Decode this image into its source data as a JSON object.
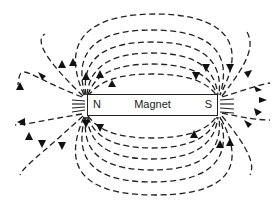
{
  "diagram": {
    "type": "magnetic-field-lines",
    "magnet": {
      "label": "Magnet",
      "north_pole": "N",
      "south_pole": "S"
    },
    "field_lines": {
      "style": "dashed",
      "direction": "from N (left) to S (right)",
      "upper_loops": 8,
      "lower_loops": 8
    },
    "colors": {
      "line": "#222222",
      "background": "#ffffff"
    }
  }
}
